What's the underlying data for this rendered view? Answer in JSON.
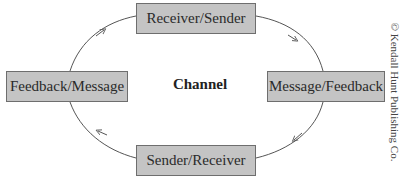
{
  "diagram": {
    "center_label": "Channel",
    "nodes": {
      "top": "Receiver/Sender",
      "right": "Message/Feedback",
      "bottom": "Sender/Receiver",
      "left": "Feedback/Message"
    },
    "edges": [
      {
        "from": "left",
        "to": "top",
        "direction": "clockwise"
      },
      {
        "from": "top",
        "to": "right",
        "direction": "clockwise"
      },
      {
        "from": "right",
        "to": "bottom",
        "direction": "clockwise"
      },
      {
        "from": "bottom",
        "to": "left",
        "direction": "clockwise"
      }
    ],
    "credit": "© Kendall Hunt Publishing Co."
  },
  "colors": {
    "node_fill": "#c4c4c4",
    "node_border": "#6e6e6e",
    "line": "#555555",
    "text": "#2a2a2a"
  }
}
